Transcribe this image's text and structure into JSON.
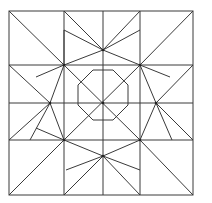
{
  "diagram": {
    "stroke": "#3a3a3a",
    "background": "#ffffff",
    "frame": {
      "x": 9,
      "y": 11,
      "w": 184,
      "h": 184
    },
    "lines": [
      [
        64,
        11,
        64,
        65
      ],
      [
        140,
        11,
        140,
        65
      ],
      [
        9,
        65,
        64,
        65
      ],
      [
        140,
        65,
        193,
        65
      ],
      [
        9,
        140,
        64,
        140
      ],
      [
        140,
        140,
        193,
        140
      ],
      [
        64,
        140,
        64,
        195
      ],
      [
        140,
        140,
        140,
        195
      ],
      [
        9,
        11,
        64,
        65
      ],
      [
        193,
        11,
        140,
        65
      ],
      [
        9,
        195,
        64,
        140
      ],
      [
        193,
        195,
        140,
        140
      ],
      [
        64,
        11,
        103,
        50
      ],
      [
        140,
        11,
        103,
        50
      ],
      [
        193,
        65,
        156,
        103
      ],
      [
        193,
        140,
        156,
        103
      ],
      [
        64,
        195,
        103,
        156
      ],
      [
        140,
        195,
        103,
        156
      ],
      [
        9,
        65,
        50,
        103
      ],
      [
        9,
        140,
        50,
        103
      ],
      [
        64,
        65,
        103,
        50
      ],
      [
        140,
        65,
        103,
        50
      ],
      [
        140,
        65,
        156,
        103
      ],
      [
        140,
        140,
        156,
        103
      ],
      [
        64,
        140,
        103,
        156
      ],
      [
        140,
        140,
        103,
        156
      ],
      [
        64,
        65,
        50,
        103
      ],
      [
        64,
        140,
        50,
        103
      ],
      [
        103,
        11,
        103,
        50
      ],
      [
        103,
        156,
        103,
        195
      ],
      [
        9,
        103,
        50,
        103
      ],
      [
        156,
        103,
        193,
        103
      ],
      [
        64,
        65,
        64,
        140
      ],
      [
        140,
        65,
        140,
        140
      ],
      [
        64,
        65,
        140,
        65
      ],
      [
        64,
        140,
        140,
        140
      ],
      [
        103,
        50,
        103,
        156
      ],
      [
        50,
        103,
        156,
        103
      ],
      [
        64,
        65,
        140,
        140
      ],
      [
        140,
        65,
        64,
        140
      ],
      [
        64,
        30,
        64,
        65
      ],
      [
        64,
        30,
        103,
        50
      ],
      [
        30,
        140,
        50,
        103
      ],
      [
        36,
        77,
        64,
        65
      ],
      [
        140,
        30,
        103,
        50
      ],
      [
        172,
        140,
        156,
        103
      ],
      [
        170,
        77,
        140,
        65
      ],
      [
        36,
        128,
        64,
        140
      ],
      [
        66,
        170,
        103,
        156
      ],
      [
        140,
        170,
        103,
        156
      ]
    ],
    "octagon": [
      [
        93,
        70
      ],
      [
        113,
        70
      ],
      [
        128,
        85
      ],
      [
        128,
        105
      ],
      [
        113,
        120
      ],
      [
        93,
        120
      ],
      [
        78,
        105
      ],
      [
        78,
        85
      ]
    ],
    "dots": [
      [
        64,
        65
      ],
      [
        140,
        65
      ],
      [
        64,
        140
      ],
      [
        140,
        140
      ],
      [
        103,
        50
      ],
      [
        50,
        103
      ],
      [
        156,
        103
      ],
      [
        103,
        156
      ],
      [
        103,
        103
      ]
    ]
  }
}
